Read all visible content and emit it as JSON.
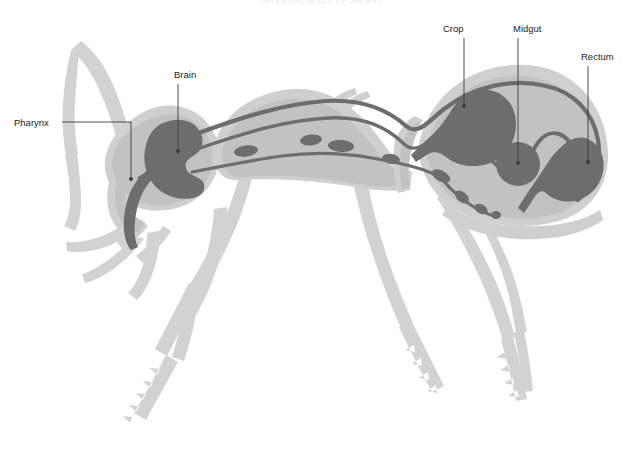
{
  "figure": {
    "title": "INTERNAL BODY OF AN ANT",
    "view": "lateral / side profile",
    "width": 644,
    "height": 458
  },
  "colors": {
    "background": "#ffffff",
    "body_outer": "#cfcfcf",
    "body_inner": "#c2c2c2",
    "legs": "#d2d2d2",
    "organ_dark": "#6d6d6d",
    "organ_mid": "#757575",
    "leader_line": "#3a3a3a",
    "label_text": "#1d1d1d",
    "title_text": "#e8e8ec"
  },
  "labels": [
    {
      "id": "pharynx",
      "text": "Pharynx",
      "text_x": 14,
      "text_y": 126,
      "anchor": "start",
      "leader": "M 62,122 L 131,122 L 131,179",
      "dot_x": 131,
      "dot_y": 179
    },
    {
      "id": "brain",
      "text": "Brain",
      "text_x": 174,
      "text_y": 78,
      "anchor": "start",
      "leader": "M 178,84 L 178,151",
      "dot_x": 178,
      "dot_y": 151
    },
    {
      "id": "crop",
      "text": "Crop",
      "text_x": 443,
      "text_y": 32,
      "anchor": "start",
      "leader": "M 464,38 L 464,106",
      "dot_x": 464,
      "dot_y": 106
    },
    {
      "id": "midgut",
      "text": "Midgut",
      "text_x": 513,
      "text_y": 32,
      "anchor": "start",
      "leader": "M 518,38 L 518,163",
      "dot_x": 518,
      "dot_y": 163
    },
    {
      "id": "rectum",
      "text": "Rectum",
      "text_x": 581,
      "text_y": 60,
      "anchor": "start",
      "leader": "M 588,66 L 588,162",
      "dot_x": 588,
      "dot_y": 162
    }
  ],
  "organs": [
    {
      "id": "brain",
      "name": "Brain",
      "region": "head",
      "cx": 178,
      "cy": 151
    },
    {
      "id": "pharynx",
      "name": "Pharynx",
      "region": "head",
      "cx": 131,
      "cy": 179
    },
    {
      "id": "esophagus",
      "name": "Esophagus",
      "region": "thorax"
    },
    {
      "id": "dorsal-vessel",
      "name": "Dorsal vessel",
      "region": "thorax"
    },
    {
      "id": "nerve-cord",
      "name": "Ventral nerve cord",
      "region": "thorax"
    },
    {
      "id": "crop",
      "name": "Crop",
      "region": "gaster",
      "cx": 464,
      "cy": 106
    },
    {
      "id": "midgut",
      "name": "Midgut",
      "region": "gaster",
      "cx": 518,
      "cy": 163
    },
    {
      "id": "rectum",
      "name": "Rectum",
      "region": "gaster",
      "cx": 588,
      "cy": 162
    }
  ],
  "body_parts": [
    {
      "id": "head",
      "name": "Head"
    },
    {
      "id": "antenna",
      "name": "Antenna"
    },
    {
      "id": "mandible",
      "name": "Mandible"
    },
    {
      "id": "thorax",
      "name": "Thorax"
    },
    {
      "id": "petiole",
      "name": "Petiole"
    },
    {
      "id": "gaster",
      "name": "Gaster"
    },
    {
      "id": "foreleg",
      "name": "Foreleg"
    },
    {
      "id": "midleg",
      "name": "Midleg"
    },
    {
      "id": "hindleg",
      "name": "Hindleg"
    }
  ]
}
